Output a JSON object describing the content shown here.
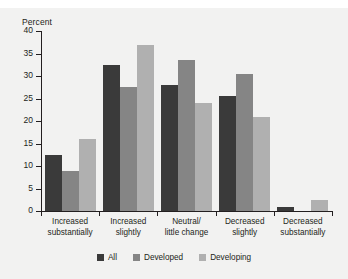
{
  "top_fragment": "",
  "chart_data": {
    "type": "bar",
    "title": "",
    "subtitle": "",
    "xlabel": "",
    "ylabel": "Percent",
    "ylim": [
      0,
      40
    ],
    "ytick_step": 5,
    "yticks": [
      0,
      5,
      10,
      15,
      20,
      25,
      30,
      35,
      40
    ],
    "ytick_labels": [
      "0",
      "5",
      "10",
      "15",
      "20",
      "25",
      "30",
      "35",
      "40"
    ],
    "grid": false,
    "legend_position": "bottom",
    "categories": [
      "Increased\nsubstantially",
      "Increased\nslightly",
      "Neutral/\nlittle change",
      "Decreased\nslightly",
      "Decreased\nsubstantially"
    ],
    "series": [
      {
        "name": "All",
        "color": "#3a3a3a",
        "values": [
          12.5,
          32.5,
          28.0,
          25.5,
          1.0
        ]
      },
      {
        "name": "Developed",
        "color": "#858585",
        "values": [
          9.0,
          27.5,
          33.5,
          30.5,
          0.0
        ]
      },
      {
        "name": "Developing",
        "color": "#b0b0b0",
        "values": [
          16.0,
          37.0,
          24.0,
          21.0,
          2.5
        ]
      }
    ]
  }
}
